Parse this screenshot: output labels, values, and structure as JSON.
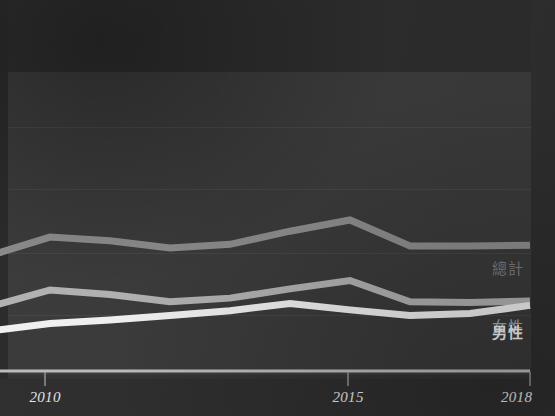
{
  "chart_data": {
    "type": "line",
    "title": "",
    "subtitle": "",
    "xlabel": "",
    "ylabel": "",
    "grid": true,
    "legend_position": "right-inline-end-of-line",
    "x": [
      2009,
      2010,
      2011,
      2012,
      2013,
      2014,
      2015,
      2016,
      2017,
      2018
    ],
    "xlim": [
      2009,
      2018
    ],
    "xticks": [
      2010,
      2015,
      2018
    ],
    "xtick_labels": [
      "2010",
      "2015",
      "2018"
    ],
    "ylim": [
      0,
      100
    ],
    "yticks": [],
    "ytick_labels": [],
    "gridlines_y": [
      83,
      61,
      38,
      16
    ],
    "series": [
      {
        "name": "總計",
        "label": "總計",
        "color": "#8d8d8d",
        "values": [
          37.3,
          43.9,
          42.6,
          40.0,
          41.3,
          46.0,
          50.0,
          40.7,
          40.7,
          41.0
        ]
      },
      {
        "name": "女性",
        "label": "女性",
        "color": "#b2b2b2",
        "values": [
          19.1,
          25.0,
          23.4,
          20.8,
          22.1,
          25.4,
          28.4,
          20.8,
          20.5,
          21.1
        ]
      },
      {
        "name": "男性",
        "label": "男性",
        "color": "#f2f2f2",
        "values": [
          10.4,
          13.0,
          14.3,
          15.9,
          17.6,
          20.2,
          17.9,
          15.9,
          16.6,
          19.5
        ]
      }
    ]
  },
  "axis": {
    "ticks": [
      {
        "label": "2010",
        "x_px": 45
      },
      {
        "label": "2015",
        "x_px": 348
      },
      {
        "label": "2018",
        "x_px": 530
      }
    ]
  },
  "legend": {
    "items": [
      {
        "label": "總計",
        "color": "#7c7c7c"
      },
      {
        "label": "女性",
        "color": "#a9a9a9"
      },
      {
        "label": "男性",
        "color": "#f4f4f4"
      }
    ]
  },
  "colors": {
    "background": "#333333",
    "plot_background": "#3a3a3a",
    "header_band": "#2c2c2c",
    "gridline": "#454545",
    "axis": "#bdbdbd",
    "total": "#8d8d8d",
    "female": "#b2b2b2",
    "male": "#f2f2f2"
  }
}
